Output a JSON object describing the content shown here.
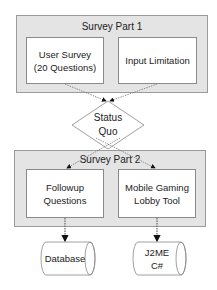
{
  "survey_part_1": {
    "title": "Survey Part 1",
    "boxes": [
      {
        "label": "User Survey\n(20 Questions)"
      },
      {
        "label": "Input Limitation"
      }
    ]
  },
  "decision": {
    "label": "Status\nQuo"
  },
  "survey_part_2": {
    "title": "Survey Part 2",
    "boxes": [
      {
        "label": "Followup\nQuestions"
      },
      {
        "label": "Mobile Gaming\nLobby Tool"
      }
    ]
  },
  "stores": [
    {
      "label": "Database"
    },
    {
      "label": "J2ME\nC#"
    }
  ],
  "colors": {
    "group_fill": "#e4e4e4",
    "box_fill": "#ffffff",
    "border": "#8a8a8a",
    "arrow": "#111111"
  }
}
